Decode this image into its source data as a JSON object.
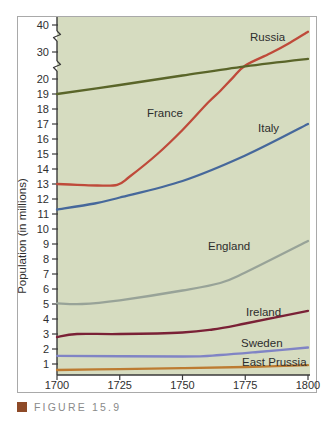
{
  "figure": {
    "caption": "FIGURE 15.9",
    "caption_square_color": "#8e4a28",
    "caption_text_color": "#8a8a8a"
  },
  "chart_data": {
    "type": "line",
    "title": "",
    "xlabel": "",
    "ylabel": "Population (in millions)",
    "x_range": [
      1700,
      1800
    ],
    "x_ticks": [
      1700,
      1725,
      1750,
      1775,
      1800
    ],
    "y_axis": {
      "linear_ticks": [
        1,
        2,
        3,
        4,
        5,
        6,
        7,
        8,
        9,
        10,
        11,
        12,
        13,
        14,
        15,
        16,
        17,
        18,
        19,
        20
      ],
      "compressed_ticks": [
        30,
        40
      ],
      "has_axis_breaks": true
    },
    "layout": {
      "plot_bg": "#d6dcc0",
      "axis_color": "#3a3a3a",
      "tick_label_color": "#2f2f2f",
      "series_label_color": "#2d2d2d",
      "grid": false,
      "legend": "inline-labels"
    },
    "series": [
      {
        "name": "Russia",
        "color": "#bf4a3a",
        "label_xy": [
          250,
          41
        ],
        "points": [
          [
            1700,
            13
          ],
          [
            1708,
            12.95
          ],
          [
            1716,
            12.9
          ],
          [
            1724,
            12.95
          ],
          [
            1729,
            13.5
          ],
          [
            1740,
            15
          ],
          [
            1750,
            16.6
          ],
          [
            1760,
            18.4
          ],
          [
            1765,
            19.2
          ],
          [
            1770,
            20.4
          ],
          [
            1775,
            25
          ],
          [
            1785,
            29.5
          ],
          [
            1793,
            33.5
          ],
          [
            1800,
            37.5
          ]
        ]
      },
      {
        "name": "France",
        "color": "#5a6529",
        "label_xy": [
          147,
          117
        ],
        "points": [
          [
            1700,
            19
          ],
          [
            1725,
            19.6
          ],
          [
            1750,
            21.3
          ],
          [
            1775,
            24.7
          ],
          [
            1800,
            27.5
          ]
        ]
      },
      {
        "name": "Italy",
        "color": "#46689b",
        "label_xy": [
          258,
          132
        ],
        "points": [
          [
            1700,
            11.3
          ],
          [
            1715,
            11.7
          ],
          [
            1725,
            12.1
          ],
          [
            1750,
            13.2
          ],
          [
            1775,
            14.9
          ],
          [
            1800,
            17
          ]
        ]
      },
      {
        "name": "England",
        "color": "#98a398",
        "label_xy": [
          208,
          250
        ],
        "points": [
          [
            1700,
            5.05
          ],
          [
            1710,
            5.0
          ],
          [
            1725,
            5.25
          ],
          [
            1750,
            5.9
          ],
          [
            1765,
            6.4
          ],
          [
            1775,
            7.1
          ],
          [
            1800,
            9.2
          ]
        ]
      },
      {
        "name": "Ireland",
        "color": "#7a2136",
        "label_xy": [
          246,
          316
        ],
        "points": [
          [
            1700,
            2.8
          ],
          [
            1708,
            3.0
          ],
          [
            1725,
            3.0
          ],
          [
            1750,
            3.1
          ],
          [
            1762,
            3.3
          ],
          [
            1775,
            3.7
          ],
          [
            1800,
            4.55
          ]
        ]
      },
      {
        "name": "Sweden",
        "color": "#8084c5",
        "label_xy": [
          241,
          347
        ],
        "points": [
          [
            1700,
            1.55
          ],
          [
            1750,
            1.5
          ],
          [
            1765,
            1.6
          ],
          [
            1780,
            1.8
          ],
          [
            1800,
            2.1
          ]
        ]
      },
      {
        "name": "East Prussia",
        "color": "#bd7b31",
        "label_xy": [
          242,
          366
        ],
        "points": [
          [
            1700,
            0.6
          ],
          [
            1725,
            0.66
          ],
          [
            1750,
            0.73
          ],
          [
            1775,
            0.8
          ],
          [
            1800,
            0.92
          ]
        ]
      }
    ]
  }
}
